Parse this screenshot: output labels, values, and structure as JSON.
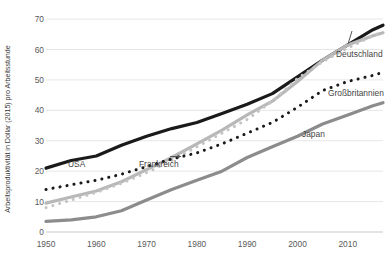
{
  "chart_data": {
    "type": "line",
    "title": "",
    "subtitle": "",
    "xlabel": "",
    "ylabel": "Arbeitsproduktivität in Dollar (2015) pro Arbeitsstunde",
    "xlim": [
      1950,
      2017
    ],
    "ylim": [
      0,
      72
    ],
    "xticks": [
      "1950",
      "1960",
      "1970",
      "1980",
      "1990",
      "2000",
      "2010"
    ],
    "xtick_values": [
      1950,
      1960,
      1970,
      1980,
      1990,
      2000,
      2010
    ],
    "yticks": [
      "0",
      "10",
      "20",
      "30",
      "40",
      "50",
      "60",
      "70"
    ],
    "ytick_values": [
      0,
      10,
      20,
      30,
      40,
      50,
      60,
      70
    ],
    "grid": "horizontal",
    "legend_position": "inline-annotations",
    "x": [
      1950,
      1955,
      1960,
      1965,
      1970,
      1975,
      1980,
      1985,
      1990,
      1995,
      2000,
      2005,
      2010,
      2015,
      2017
    ],
    "series": [
      {
        "name": "USA",
        "style": "solid",
        "color": "#1a1a1a",
        "width": 3.2,
        "label_x": 68,
        "label_y": 159,
        "values": [
          21.0,
          23.5,
          25.0,
          28.5,
          31.5,
          34.0,
          36.0,
          39.0,
          42.0,
          45.5,
          51.0,
          56.5,
          61.5,
          66.5,
          68.0
        ]
      },
      {
        "name": "Frankreich",
        "style": "solid",
        "color": "#b8b8b8",
        "width": 3.2,
        "label_x": 139,
        "label_y": 159,
        "values": [
          9.5,
          11.5,
          13.5,
          16.5,
          20.5,
          24.5,
          29.0,
          33.5,
          38.5,
          43.0,
          49.5,
          56.5,
          61.5,
          64.5,
          65.5
        ]
      },
      {
        "name": "Deutschland",
        "style": "dotted",
        "color": "#c4c4c4",
        "width": 3.0,
        "label_x": 336,
        "label_y": 49,
        "values": [
          8.0,
          10.5,
          13.0,
          16.0,
          19.5,
          23.5,
          28.0,
          32.5,
          37.0,
          43.0,
          50.5,
          56.0,
          60.5,
          64.5,
          66.0
        ]
      },
      {
        "name": "Großbritannien",
        "style": "dotted",
        "color": "#1a1a1a",
        "width": 3.0,
        "label_x": 328,
        "label_y": 88,
        "values": [
          14.0,
          15.5,
          17.0,
          19.0,
          21.5,
          24.0,
          26.0,
          29.0,
          32.5,
          36.0,
          41.0,
          46.5,
          49.5,
          51.5,
          52.5
        ]
      },
      {
        "name": "Japan",
        "style": "solid",
        "color": "#8c8c8c",
        "width": 3.2,
        "label_x": 302,
        "label_y": 129,
        "values": [
          3.5,
          4.0,
          5.0,
          7.0,
          10.5,
          14.0,
          17.0,
          20.0,
          24.5,
          28.0,
          31.5,
          35.5,
          38.5,
          41.5,
          42.5
        ]
      }
    ]
  },
  "axis": {
    "y_axis_label": "Arbeitsproduktivität in Dollar (2015) pro Arbeitsstunde"
  }
}
